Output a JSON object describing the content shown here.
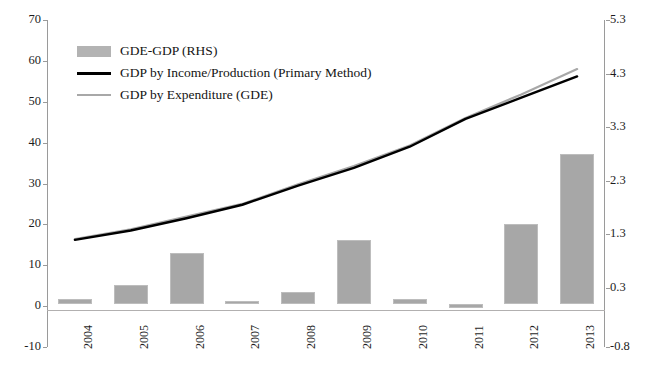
{
  "header": {
    "cut_off_text": ""
  },
  "chart_data": {
    "type": "bar",
    "title": "",
    "subtitle": "",
    "xlabel": "",
    "ylabel": "",
    "categories": [
      "2004",
      "2005",
      "2006",
      "2007",
      "2008",
      "2009",
      "2010",
      "2011",
      "2012",
      "2013"
    ],
    "left_axis": {
      "label": "",
      "ticks": [
        "-10",
        "0",
        "10",
        "20",
        "30",
        "40",
        "50",
        "60",
        "70"
      ],
      "tick_values": [
        -10,
        0,
        10,
        20,
        30,
        40,
        50,
        60,
        70
      ],
      "ylim": [
        -10,
        70
      ]
    },
    "right_axis": {
      "label": "RHS",
      "ticks": [
        "-0.8",
        "0.3",
        "1.3",
        "2.3",
        "3.3",
        "4.3",
        "5.3"
      ],
      "tick_values": [
        -0.8,
        0.3,
        1.3,
        2.3,
        3.3,
        4.3,
        5.3
      ],
      "ylim": [
        -0.8,
        5.3
      ]
    },
    "grid": false,
    "legend_position": "upper-left",
    "series": [
      {
        "name": "GDE-GDP (RHS)",
        "type": "bar",
        "axis": "right",
        "color": "#a7a7a7",
        "values": [
          0.1,
          0.35,
          0.95,
          0.06,
          0.22,
          1.2,
          0.1,
          -0.08,
          1.5,
          2.8
        ]
      },
      {
        "name": "GDP by Income/Production (Primary Method)",
        "type": "line",
        "axis": "left",
        "color": "#000000",
        "values": [
          16.2,
          18.5,
          21.5,
          24.8,
          29.5,
          33.8,
          39.0,
          45.8,
          51.0,
          56.2
        ]
      },
      {
        "name": "GDP by Expenditure (GDE)",
        "type": "line",
        "axis": "left",
        "color": "#a8a8a8",
        "values": [
          16.4,
          18.8,
          21.9,
          25.0,
          29.8,
          34.3,
          39.3,
          46.0,
          51.8,
          58.0
        ]
      }
    ]
  },
  "legend": {
    "items": [
      {
        "label": "GDE-GDP (RHS)",
        "marker": "bar-swatch"
      },
      {
        "label": "GDP by Income/Production (Primary Method)",
        "marker": "line-black"
      },
      {
        "label": "GDP by Expenditure (GDE)",
        "marker": "line-gray"
      }
    ]
  },
  "colors": {
    "bar": "#a7a7a7",
    "line_primary": "#000000",
    "line_secondary": "#a8a8a8",
    "axis": "#9a9a9a",
    "text": "#1c1c1c",
    "background": "#ffffff"
  }
}
